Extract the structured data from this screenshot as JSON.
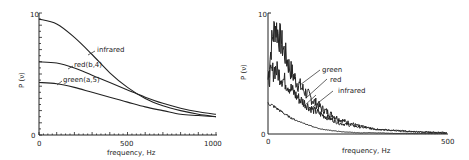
{
  "chart_data": [
    {
      "type": "line",
      "title": "",
      "xlabel": "frequency, Hz",
      "ylabel": "P (ν)",
      "xlim": [
        0,
        1000
      ],
      "ylim": [
        0,
        10
      ],
      "x_ticks": [
        "0",
        "500",
        "1000"
      ],
      "y_ticks": [
        "0",
        "10"
      ],
      "grid": false,
      "legend": "inline labels",
      "x": [
        0,
        100,
        200,
        300,
        400,
        500,
        600,
        700,
        800,
        900,
        1000
      ],
      "series": [
        {
          "name": "infrared",
          "values": [
            9.5,
            9.1,
            8.0,
            6.6,
            5.1,
            3.9,
            3.0,
            2.4,
            2.0,
            1.7,
            1.5
          ]
        },
        {
          "name": "red(b,4)",
          "values": [
            6.0,
            5.9,
            5.5,
            4.9,
            4.3,
            3.7,
            3.1,
            2.6,
            2.2,
            1.9,
            1.7
          ]
        },
        {
          "name": "green(a,5)",
          "values": [
            4.3,
            4.2,
            3.9,
            3.5,
            3.1,
            2.7,
            2.3,
            2.0,
            1.7,
            1.6,
            1.5
          ]
        }
      ]
    },
    {
      "type": "line",
      "title": "",
      "xlabel": "frequency, Hz",
      "ylabel": "P (ν)",
      "xlim": [
        0,
        500
      ],
      "ylim": [
        0,
        10
      ],
      "x_ticks": [
        "0",
        "500"
      ],
      "y_ticks": [
        "0",
        "10"
      ],
      "grid": false,
      "legend": "inline labels",
      "x": [
        0,
        10,
        20,
        30,
        40,
        60,
        80,
        100,
        125,
        150,
        200,
        250,
        300,
        350,
        400,
        450,
        500
      ],
      "series": [
        {
          "name": "green",
          "values": [
            4.5,
            7.5,
            9.0,
            8.2,
            7.3,
            5.5,
            4.3,
            3.6,
            2.8,
            2.1,
            1.2,
            0.7,
            0.4,
            0.3,
            0.2,
            0.15,
            0.1
          ]
        },
        {
          "name": "red",
          "values": [
            4.5,
            5.0,
            5.4,
            5.0,
            4.6,
            3.9,
            3.1,
            2.6,
            2.0,
            1.6,
            0.9,
            0.6,
            0.4,
            0.3,
            0.2,
            0.15,
            0.1
          ]
        },
        {
          "name": "infrared",
          "values": [
            2.5,
            2.4,
            2.2,
            2.0,
            1.8,
            1.4,
            1.1,
            0.9,
            0.6,
            0.4,
            0.2,
            0.1,
            0.1,
            0.05,
            0.05,
            0.05,
            0.05
          ]
        }
      ]
    }
  ],
  "left": {
    "ylabel": "P (ν)",
    "xlabel": "frequency, Hz",
    "y_top": "10",
    "y_bottom": "0",
    "x0": "0",
    "x1": "500",
    "x2": "1000",
    "labels": {
      "infrared": "infrared",
      "red": "red(b,4)",
      "green": "green(a,5)"
    }
  },
  "right": {
    "ylabel": "P (ν)",
    "xlabel": "frequency, Hz",
    "y_top": "10",
    "y_bottom": "0",
    "x0": "0",
    "x1": "500",
    "labels": {
      "green": "green",
      "red": "red",
      "infrared": "infrared"
    }
  }
}
